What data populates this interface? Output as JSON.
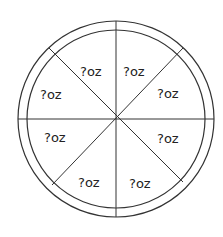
{
  "diagram": {
    "type": "pizza-slices",
    "slice_count": 8,
    "colors": {
      "line": "#333333",
      "background": "#ffffff",
      "text": "#222222"
    },
    "slices": [
      {
        "label": "?oz"
      },
      {
        "label": "?oz"
      },
      {
        "label": "?oz"
      },
      {
        "label": "?oz"
      },
      {
        "label": "?oz"
      },
      {
        "label": "?oz"
      },
      {
        "label": "?oz"
      },
      {
        "label": "?oz"
      }
    ]
  }
}
